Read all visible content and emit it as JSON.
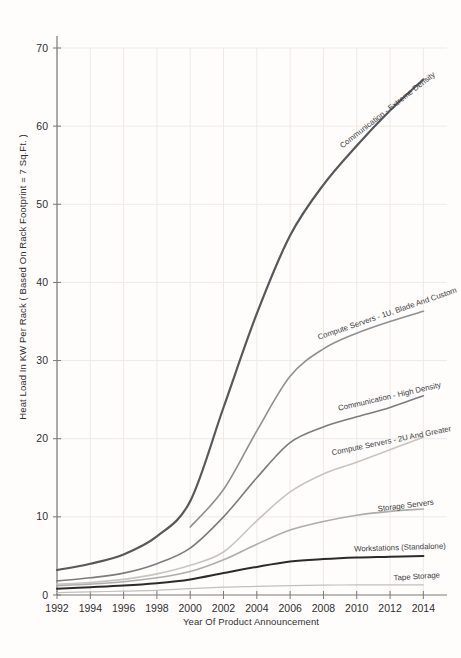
{
  "figure": {
    "background": "#fefdfc",
    "axis_color": "#7a7a78",
    "tick_label_color": "#2e2e2e",
    "grid_color": "#edeae5",
    "series_label_color": "#3c3c3c"
  },
  "chart_data": {
    "type": "line",
    "title": "",
    "xlabel": "Year Of Product Announcement",
    "ylabel": "Heat Load In KW Per Rack ( Based On Rack Footprint = 7 Sq.Ft. )",
    "xlim": [
      1992,
      2015.3
    ],
    "ylim": [
      0,
      70
    ],
    "x_ticks": [
      1992,
      1994,
      1996,
      1998,
      2000,
      2002,
      2004,
      2006,
      2008,
      2010,
      2012,
      2014
    ],
    "y_ticks": [
      0,
      10,
      20,
      30,
      40,
      50,
      60,
      70
    ],
    "grid": true,
    "legend_position": "inline-curve-labels",
    "series": [
      {
        "name": "Communication - Extreme Density",
        "color": "#57585a",
        "width": 2.2,
        "x": [
          1992,
          1994,
          1996,
          1998,
          2000,
          2002,
          2004,
          2006,
          2008,
          2010,
          2012,
          2014
        ],
        "values": [
          3.2,
          4.0,
          5.2,
          7.5,
          12.0,
          24.0,
          36.0,
          46.0,
          52.5,
          57.5,
          62.0,
          66.0
        ],
        "label": {
          "x": 389,
          "y": 112,
          "angle": -38
        }
      },
      {
        "name": "Compute Servers - 1U, Blade And Custom",
        "color": "#8f9092",
        "width": 1.6,
        "x": [
          2000,
          2002,
          2004,
          2006,
          2008,
          2010,
          2012,
          2014
        ],
        "values": [
          8.7,
          13.5,
          21.0,
          28.0,
          31.5,
          33.5,
          35.0,
          36.3
        ],
        "label": {
          "x": 388,
          "y": 316,
          "angle": -19
        }
      },
      {
        "name": "Communication - High Density",
        "color": "#7b7c7e",
        "width": 1.6,
        "x": [
          1992,
          1994,
          1996,
          1998,
          2000,
          2002,
          2004,
          2006,
          2008,
          2010,
          2012,
          2014
        ],
        "values": [
          1.8,
          2.2,
          2.8,
          4.0,
          6.0,
          10.0,
          15.0,
          19.5,
          21.5,
          22.8,
          24.0,
          25.5
        ],
        "label": {
          "x": 390,
          "y": 399,
          "angle": -13
        }
      },
      {
        "name": "Compute Servers - 2U And Greater",
        "color": "#c8c5c0",
        "width": 1.6,
        "x": [
          1992,
          1994,
          1996,
          1998,
          2000,
          2002,
          2004,
          2006,
          2008,
          2010,
          2012,
          2014
        ],
        "values": [
          1.4,
          1.6,
          2.0,
          2.7,
          3.8,
          5.5,
          9.5,
          13.2,
          15.5,
          17.0,
          18.6,
          20.2
        ],
        "label": {
          "x": 392,
          "y": 443,
          "angle": -11.5
        }
      },
      {
        "name": "Storage Servers",
        "color": "#aeadaa",
        "width": 1.6,
        "x": [
          1992,
          1994,
          1996,
          1998,
          2000,
          2002,
          2004,
          2006,
          2008,
          2010,
          2012,
          2014
        ],
        "values": [
          1.2,
          1.4,
          1.7,
          2.2,
          3.0,
          4.5,
          6.5,
          8.3,
          9.4,
          10.2,
          10.7,
          11.0
        ],
        "label": {
          "x": 406,
          "y": 508,
          "angle": -7
        }
      },
      {
        "name": "Workstations (Standalone)",
        "color": "#2b2b2b",
        "width": 2.0,
        "x": [
          1992,
          1994,
          1996,
          1998,
          2000,
          2002,
          2004,
          2006,
          2008,
          2010,
          2012,
          2014
        ],
        "values": [
          0.8,
          1.0,
          1.2,
          1.5,
          2.0,
          2.8,
          3.6,
          4.3,
          4.6,
          4.8,
          4.9,
          5.0
        ],
        "label": {
          "x": 400,
          "y": 550,
          "angle": -2
        }
      },
      {
        "name": "Tape Storage",
        "color": "#c2c0bc",
        "width": 1.2,
        "x": [
          1992,
          1994,
          1996,
          1998,
          2000,
          2002,
          2004,
          2006,
          2008,
          2010,
          2012,
          2014
        ],
        "values": [
          0.3,
          0.4,
          0.5,
          0.6,
          0.8,
          1.0,
          1.1,
          1.2,
          1.25,
          1.3,
          1.3,
          1.3
        ],
        "label": {
          "x": 417,
          "y": 579,
          "angle": -4
        }
      }
    ],
    "layout": {
      "plot": {
        "left": 57,
        "right": 445,
        "top": 48,
        "bottom": 595
      },
      "axis_top_y": 36,
      "axis_right_x": 447,
      "tick_half_len": 4,
      "y_tick_label_x": 48,
      "x_tick_label_y": 612,
      "tick_font_size": 10.5,
      "series_label_font_size": 7.8
    }
  }
}
